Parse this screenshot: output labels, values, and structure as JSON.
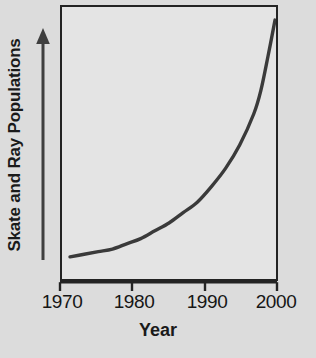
{
  "chart_data": {
    "type": "line",
    "title": "",
    "xlabel": "Year",
    "ylabel": "Skate and Ray Populations",
    "xlim": [
      1970,
      2000
    ],
    "ylim": [
      0,
      1
    ],
    "grid": false,
    "legend": null,
    "xtick_labels": [
      "1970",
      "1980",
      "1990",
      "2000"
    ],
    "xtick_values": [
      1970,
      1980,
      1990,
      2000
    ],
    "ytick_labels": [],
    "y_axis_style": "unlabeled upward arrow indicating increasing population",
    "series": [
      {
        "name": "Skate and Ray Populations",
        "color": "#3a3a3a",
        "x": [
          1971,
          1973,
          1975,
          1977,
          1979,
          1981,
          1983,
          1985,
          1987,
          1989,
          1991,
          1993,
          1995,
          1997,
          1998,
          1999,
          2000
        ],
        "y": [
          0.07,
          0.08,
          0.09,
          0.1,
          0.12,
          0.14,
          0.17,
          0.2,
          0.24,
          0.28,
          0.34,
          0.41,
          0.5,
          0.62,
          0.71,
          0.84,
          0.98
        ]
      }
    ],
    "annotations": [],
    "colors": {
      "figure_background": "#dcdcdc",
      "plot_background": "#e4e4e4",
      "axis_frame": "#232323",
      "curve": "#3a3a3a",
      "text": "#1a1a1a"
    }
  },
  "axes": {
    "y_label_text": "Skate and Ray Populations",
    "x_label_text": "Year"
  },
  "ticks": [
    {
      "label": "1970",
      "x_px": 60
    },
    {
      "label": "1980",
      "x_px": 132
    },
    {
      "label": "1990",
      "x_px": 205
    },
    {
      "label": "2000",
      "x_px": 277
    }
  ],
  "icons": {
    "y_axis_arrow": "arrow-up-icon"
  }
}
